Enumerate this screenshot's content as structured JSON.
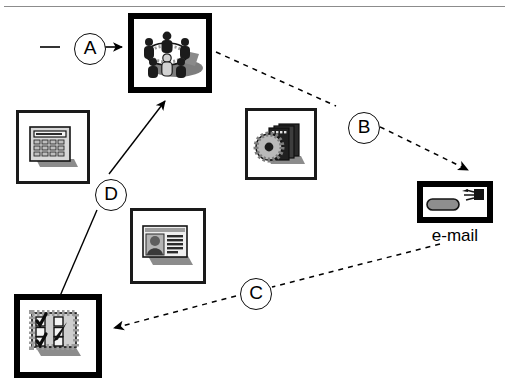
{
  "figure": {
    "type": "diagram",
    "title": "",
    "background_color": "#ffffff",
    "line_color": "#000000",
    "has_top_rule": true
  },
  "nodes": [
    {
      "id": "meeting",
      "icon_name": "meeting-table-icon",
      "description": "group of people seated around a round conference table",
      "caption": "",
      "emphasis": "thick",
      "x": 128,
      "y": 13,
      "w": 84,
      "h": 80
    },
    {
      "id": "calculator",
      "icon_name": "calculator-icon",
      "description": "desktop calculator with keypad and display",
      "caption": "",
      "emphasis": "thin",
      "x": 16,
      "y": 110,
      "w": 74,
      "h": 74
    },
    {
      "id": "cd-software",
      "icon_name": "cd-software-box-icon",
      "description": "compact disc leaning against a stack of software boxes",
      "caption": "",
      "emphasis": "thin",
      "x": 245,
      "y": 108,
      "w": 72,
      "h": 72
    },
    {
      "id": "id-card",
      "icon_name": "id-card-icon",
      "description": "identity card / article with portrait photo and text lines",
      "caption": "",
      "emphasis": "thin",
      "x": 130,
      "y": 208,
      "w": 76,
      "h": 76
    },
    {
      "id": "checklist",
      "icon_name": "checklist-icon",
      "description": "form with ticked checkboxes and a pen",
      "caption": "",
      "emphasis": "thick",
      "x": 14,
      "y": 294,
      "w": 88,
      "h": 84
    },
    {
      "id": "email",
      "icon_name": "email-device-icon",
      "description": "e-mail terminal box with antenna plug and rounded key",
      "caption": "e-mail",
      "emphasis": "thick",
      "x": 417,
      "y": 181,
      "w": 76,
      "h": 42
    }
  ],
  "connectors": [
    {
      "id": "A",
      "label": "A",
      "style": "solid",
      "arrow": true,
      "from": "external-left",
      "to": "meeting",
      "label_x": 74,
      "label_y": 33
    },
    {
      "id": "B",
      "label": "B",
      "style": "dashed",
      "arrow": true,
      "from": "meeting",
      "to": "email",
      "label_x": 348,
      "label_y": 112
    },
    {
      "id": "C",
      "label": "C",
      "style": "dashed",
      "arrow": true,
      "from": "email",
      "to": "checklist",
      "label_x": 240,
      "label_y": 278
    },
    {
      "id": "D",
      "label": "D",
      "style": "solid",
      "arrow": true,
      "from": "checklist",
      "to": "meeting",
      "label_x": 95,
      "label_y": 179
    }
  ],
  "labels": {
    "A": "A",
    "B": "B",
    "C": "C",
    "D": "D",
    "email_caption": "e-mail"
  }
}
